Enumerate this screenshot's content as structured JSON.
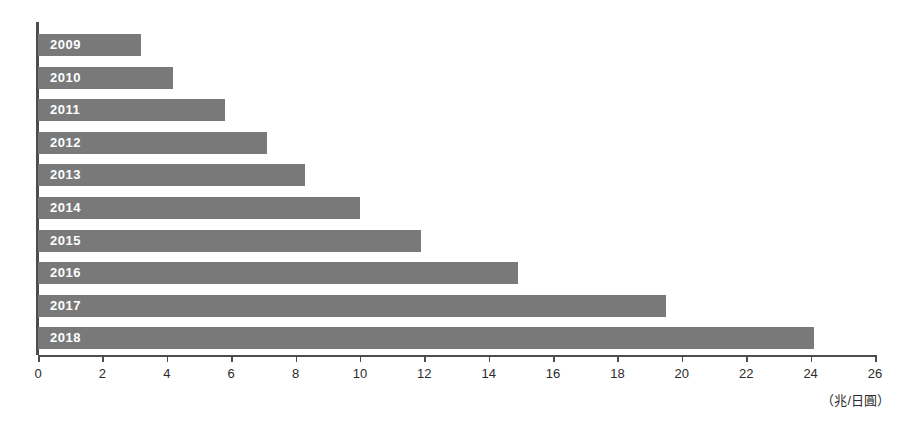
{
  "chart_data": {
    "type": "bar",
    "orientation": "horizontal",
    "title": "",
    "subtitle": "",
    "xlabel": "（兆/日圓）",
    "ylabel": "",
    "categories": [
      "2009",
      "2010",
      "2011",
      "2012",
      "2013",
      "2014",
      "2015",
      "2016",
      "2017",
      "2018"
    ],
    "values": [
      3.2,
      4.2,
      5.8,
      7.1,
      8.3,
      10.0,
      11.9,
      14.9,
      19.5,
      24.1
    ],
    "xlim": [
      0,
      26
    ],
    "xticks": [
      0,
      2,
      4,
      6,
      8,
      10,
      12,
      14,
      16,
      18,
      20,
      22,
      24,
      26
    ],
    "xtick_labels": [
      "0",
      "2",
      "4",
      "6",
      "8",
      "10",
      "12",
      "14",
      "16",
      "18",
      "20",
      "22",
      "24",
      "26"
    ],
    "grid": false,
    "legend": null,
    "bar_color": "#797979",
    "bar_label_color": "#ffffff",
    "axis_color": "#4d4d4d",
    "background_color": "#ffffff"
  }
}
